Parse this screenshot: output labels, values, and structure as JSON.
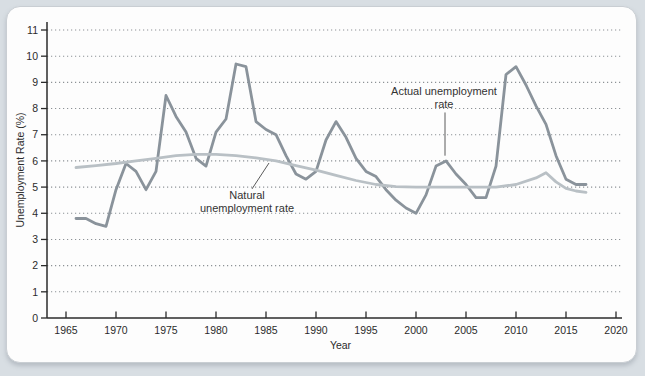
{
  "page": {
    "background": "#d8dee3",
    "card_background": "#fdfdfd",
    "card_border": "#c9ced3"
  },
  "chart_data": {
    "type": "line",
    "title": "",
    "xlabel": "Year",
    "ylabel": "Unemployment Rate (%)",
    "xlim": [
      1963.1,
      2020.6
    ],
    "ylim": [
      0,
      11
    ],
    "x_ticks": [
      1965,
      1970,
      1975,
      1980,
      1985,
      1990,
      1995,
      2000,
      2005,
      2010,
      2015,
      2020
    ],
    "y_ticks": [
      0,
      1,
      2,
      3,
      4,
      5,
      6,
      7,
      8,
      9,
      10,
      11
    ],
    "grid": "horizontal-dotted",
    "grid_color": "#8d9296",
    "axis_color": "#2b2b2b",
    "text_color": "#2b2b2b",
    "legend_position": "inline-annotations",
    "series": [
      {
        "name": "Actual unemployment rate",
        "color": "#8a939b",
        "stroke_width": 2.8,
        "x": [
          1966,
          1967,
          1968,
          1969,
          1970,
          1971,
          1972,
          1973,
          1974,
          1975,
          1976,
          1977,
          1978,
          1979,
          1980,
          1981,
          1982,
          1983,
          1984,
          1985,
          1986,
          1987,
          1988,
          1989,
          1990,
          1991,
          1992,
          1993,
          1994,
          1995,
          1996,
          1997,
          1998,
          1999,
          2000,
          2001,
          2002,
          2003,
          2004,
          2005,
          2006,
          2007,
          2008,
          2009,
          2010,
          2011,
          2012,
          2013,
          2014,
          2015,
          2016,
          2017
        ],
        "values": [
          3.8,
          3.8,
          3.6,
          3.5,
          4.9,
          5.9,
          5.6,
          4.9,
          5.6,
          8.5,
          7.7,
          7.1,
          6.1,
          5.8,
          7.1,
          7.6,
          9.7,
          9.6,
          7.5,
          7.2,
          7.0,
          6.2,
          5.5,
          5.3,
          5.6,
          6.8,
          7.5,
          6.9,
          6.1,
          5.6,
          5.4,
          4.9,
          4.5,
          4.2,
          4.0,
          4.7,
          5.8,
          6.0,
          5.5,
          5.1,
          4.6,
          4.6,
          5.8,
          9.3,
          9.6,
          8.9,
          8.1,
          7.4,
          6.2,
          5.3,
          5.1,
          5.1
        ]
      },
      {
        "name": "Natural unemployment rate",
        "color": "#b9c0c5",
        "stroke_width": 2.8,
        "x": [
          1966,
          1968,
          1970,
          1972,
          1974,
          1976,
          1978,
          1980,
          1982,
          1984,
          1986,
          1988,
          1990,
          1992,
          1994,
          1996,
          1998,
          2000,
          2002,
          2004,
          2006,
          2008,
          2010,
          2012,
          2013,
          2014,
          2015,
          2016,
          2017
        ],
        "values": [
          5.75,
          5.82,
          5.9,
          6.0,
          6.1,
          6.2,
          6.25,
          6.25,
          6.2,
          6.12,
          6.0,
          5.82,
          5.65,
          5.45,
          5.25,
          5.1,
          5.02,
          5.0,
          5.0,
          5.0,
          5.0,
          5.0,
          5.1,
          5.35,
          5.55,
          5.2,
          4.95,
          4.85,
          4.8
        ]
      }
    ],
    "annotations": [
      {
        "id": "actual-label",
        "text_lines": [
          "Actual unemployment",
          "rate"
        ],
        "x": 2002.8,
        "y": 8.5,
        "pointer": {
          "x1": 2002.9,
          "y1": 7.85,
          "x2": 2002.9,
          "y2": 6.2
        }
      },
      {
        "id": "natural-label",
        "text_lines": [
          "Natural",
          "unemployment rate"
        ],
        "x": 1983.1,
        "y": 4.55,
        "pointer": {
          "x1": 1983.6,
          "y1": 4.93,
          "x2": 1985.3,
          "y2": 5.92
        }
      }
    ]
  }
}
